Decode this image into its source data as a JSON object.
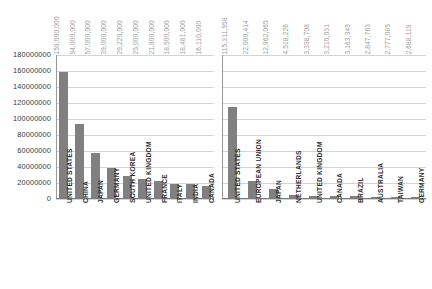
{
  "chart_data": [
    {
      "type": "bar",
      "title": "",
      "xlabel": "",
      "ylabel": "",
      "ylim": [
        0,
        180000000
      ],
      "grid": true,
      "legend": "none",
      "orientation": "vertical",
      "bar_color": "#808080",
      "gridline_color": "#d4d4d4",
      "value_label_color": "#9b9b9b",
      "ytick_labels": [
        "180000000",
        "160000000",
        "140000000",
        "120000000",
        "100000000",
        "80000000",
        "60000000",
        "40000000",
        "20000000",
        "0"
      ],
      "ytick_values": [
        180000000,
        160000000,
        140000000,
        120000000,
        100000000,
        80000000,
        60000000,
        40000000,
        20000000,
        0
      ],
      "categories": [
        "UNITED STATES",
        "CHINA",
        "JAPAN",
        "GERMANY",
        "SOUTH KOREA",
        "UNITED KINGDOM",
        "FRANCE",
        "ITALY",
        "INDIA",
        "CANADA"
      ],
      "values": [
        159000000,
        94000000,
        57000000,
        39000000,
        29220000,
        25000000,
        21900000,
        18500000,
        18481000,
        16110000
      ],
      "value_labels": [
        "159,000,000",
        "94,000,000",
        "57,000,000",
        "39,000,000",
        "29,220,000",
        "25,000,000",
        "21,900,000",
        "18,500,000",
        "18,481,000",
        "16,110,000"
      ]
    },
    {
      "type": "bar",
      "title": "",
      "xlabel": "",
      "ylabel": "",
      "ylim": [
        0,
        180000000
      ],
      "grid": true,
      "legend": "none",
      "orientation": "vertical",
      "bar_color": "#808080",
      "gridline_color": "#d4d4d4",
      "value_label_color": "#9b9b9b",
      "ytick_labels": [],
      "ytick_values": [
        180000000,
        160000000,
        140000000,
        120000000,
        100000000,
        80000000,
        60000000,
        40000000,
        20000000,
        0
      ],
      "categories": [
        "UNITED STATES",
        "EUROPEAN UNION",
        "JAPAN",
        "NETHERLANDS",
        "UNITED KINGDOM",
        "CANADA",
        "BRAZIL",
        "AUSTRALIA",
        "TAIWAN",
        "GERMANY"
      ],
      "values": [
        115311958,
        22000414,
        12962065,
        4518226,
        3338708,
        3210031,
        3163349,
        2847763,
        2777085,
        2688119
      ],
      "value_labels": [
        "115,311,958",
        "22,000,414",
        "12,962,065",
        "4,518,226",
        "3,338,708",
        "3,210,031",
        "3,163,349",
        "2,847,763",
        "2,777,085",
        "2,688,119"
      ]
    }
  ]
}
